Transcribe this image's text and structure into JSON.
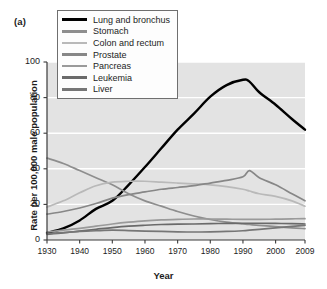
{
  "panel": {
    "label": "(a)"
  },
  "legend": {
    "position": "top-left-inside",
    "entries": [
      {
        "label": "Lung and bronchus",
        "color": "#000000"
      },
      {
        "label": "Stomach",
        "color": "#8e8e8e"
      },
      {
        "label": "Colon and rectum",
        "color": "#b9b9b9"
      },
      {
        "label": "Prostate",
        "color": "#878787"
      },
      {
        "label": "Pancreas",
        "color": "#9a9a9a"
      },
      {
        "label": "Leukemia",
        "color": "#6a6a6a"
      },
      {
        "label": "Liver",
        "color": "#767676"
      }
    ]
  },
  "axes": {
    "ylabel": "Rate per 100,000 male population",
    "xlabel": "Year",
    "yticks": [
      0,
      20,
      40,
      60,
      80,
      100
    ],
    "xticks": [
      1930,
      1940,
      1950,
      1960,
      1970,
      1980,
      1990,
      2000,
      2009
    ],
    "plot_bg": "#e3e3e3",
    "gridline_color": "#ffffff"
  },
  "chart_data": {
    "type": "line",
    "title": "",
    "xlabel": "Year",
    "ylabel": "Rate per 100,000 male population",
    "xlim": [
      1930,
      2009
    ],
    "ylim": [
      0,
      100
    ],
    "yticks": [
      0,
      20,
      40,
      60,
      80,
      100
    ],
    "xticks": [
      1930,
      1940,
      1950,
      1960,
      1970,
      1980,
      1990,
      2000,
      2009
    ],
    "grid": "horizontal-white",
    "legend_position": "upper-left",
    "x": [
      1930,
      1935,
      1940,
      1945,
      1950,
      1955,
      1960,
      1965,
      1970,
      1975,
      1980,
      1985,
      1990,
      1992,
      1995,
      2000,
      2005,
      2009
    ],
    "series": [
      {
        "name": "Lung and bronchus",
        "color": "#000000",
        "values": [
          4.0,
          6.5,
          11.0,
          17.5,
          22.0,
          31.0,
          41.0,
          51.5,
          62.0,
          71.0,
          80.5,
          87.0,
          90.0,
          89.0,
          83.0,
          76.0,
          68.0,
          62.0
        ]
      },
      {
        "name": "Stomach",
        "color": "#8e8e8e",
        "values": [
          46.0,
          43.0,
          39.0,
          35.0,
          31.0,
          26.0,
          22.0,
          19.0,
          16.0,
          13.5,
          11.5,
          10.0,
          9.0,
          8.7,
          8.2,
          7.5,
          6.8,
          6.4
        ]
      },
      {
        "name": "Colon and rectum",
        "color": "#b9b9b9",
        "values": [
          18.5,
          22.0,
          26.5,
          30.5,
          32.5,
          33.0,
          33.0,
          32.5,
          32.0,
          31.5,
          31.0,
          30.0,
          28.5,
          27.5,
          26.0,
          24.5,
          22.0,
          19.0
        ]
      },
      {
        "name": "Prostate",
        "color": "#878787",
        "values": [
          14.5,
          16.0,
          18.0,
          20.5,
          23.5,
          25.5,
          27.0,
          28.5,
          29.5,
          30.5,
          32.0,
          33.5,
          35.5,
          39.0,
          35.0,
          31.0,
          26.0,
          22.0
        ]
      },
      {
        "name": "Pancreas",
        "color": "#9a9a9a",
        "values": [
          4.5,
          5.5,
          6.5,
          7.8,
          9.0,
          10.0,
          10.8,
          11.3,
          11.6,
          11.8,
          11.8,
          11.7,
          11.6,
          11.6,
          11.6,
          11.7,
          11.9,
          12.0
        ]
      },
      {
        "name": "Leukemia",
        "color": "#6a6a6a",
        "values": [
          3.2,
          4.0,
          5.0,
          6.0,
          7.0,
          7.8,
          8.3,
          8.7,
          8.9,
          9.0,
          9.2,
          9.3,
          9.4,
          9.4,
          9.4,
          9.3,
          9.2,
          9.0
        ]
      },
      {
        "name": "Liver",
        "color": "#767676",
        "values": [
          3.5,
          4.2,
          4.8,
          5.2,
          5.5,
          5.3,
          5.0,
          4.8,
          4.6,
          4.5,
          4.6,
          4.8,
          5.2,
          5.5,
          6.0,
          6.8,
          7.6,
          8.2
        ]
      }
    ]
  }
}
